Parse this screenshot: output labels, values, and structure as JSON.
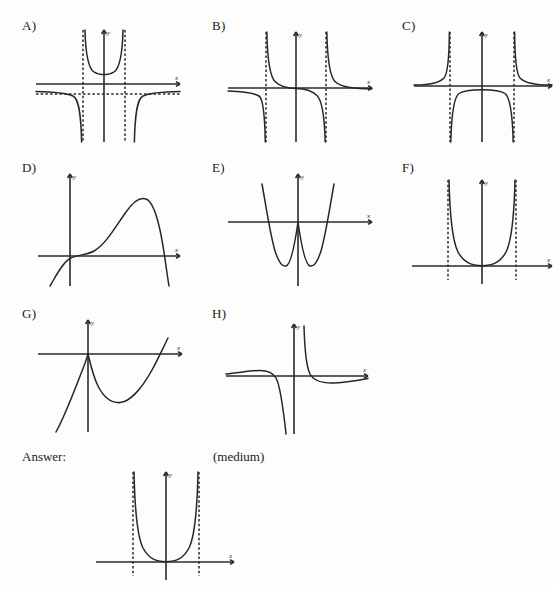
{
  "document": {
    "type": "math-worksheet",
    "topic": "identify-the-graph-multiple-choice",
    "background_color": "#fdfdfc",
    "ink_color": "#262626"
  },
  "answer_row": {
    "answer_label": "Answer:",
    "difficulty_label": "(medium)",
    "answer_matches_option": "F"
  },
  "axis_labels": {
    "x": "x",
    "y": "y"
  },
  "options": [
    {
      "id": "A",
      "label": "A)",
      "description": "rational function with two vertical asymptotes and a horizontal asymptote below the x-axis; middle branch is an upward U between the asymptotes, outer branches fall to the horizontal asymptote",
      "vertical_asymptotes": [
        -0.9,
        0.9
      ],
      "horizontal_asymptote": -0.35,
      "middle_branch": "up",
      "outer_branches": "down"
    },
    {
      "id": "B",
      "label": "B)",
      "description": "two vertical asymptotes, each branch descends to minus infinity on the left side and comes down from plus infinity on the right side; horizontal asymptote at y = 0",
      "vertical_asymptotes": [
        -1.0,
        1.0
      ],
      "horizontal_asymptote": 0,
      "middle_branch": "decreasing",
      "outer_branches": "hyperbolic"
    },
    {
      "id": "C",
      "label": "C)",
      "description": "two vertical asymptotes, outer branches rise to plus infinity, middle branch is a downward arch going to minus infinity at both asymptotes",
      "vertical_asymptotes": [
        -1.0,
        1.0
      ],
      "horizontal_asymptote": 0,
      "middle_branch": "down",
      "outer_branches": "up"
    },
    {
      "id": "D",
      "label": "D)",
      "description": "smooth cubic-like polynomial rising from lower left, crossing near the origin, peaking at the right and falling steeply through the x-axis",
      "shape": "cubic",
      "turning_points": 1,
      "x_intercepts": 2
    },
    {
      "id": "E",
      "label": "E)",
      "description": "W-shaped quartic polynomial with two minima below the x-axis and a local maximum at the origin",
      "shape": "quartic-w",
      "turning_points": 3,
      "x_intercepts": 3
    },
    {
      "id": "F",
      "label": "F)",
      "description": "U-shaped branch between two vertical asymptotes touching the x-axis at the origin, rising to plus infinity at both asymptotes",
      "vertical_asymptotes": [
        -1.0,
        1.0
      ],
      "middle_branch": "up",
      "outer_branches": "none"
    },
    {
      "id": "G",
      "label": "G)",
      "description": "curve with a sharp cusp at the y-axis, descending to a minimum and rising to cross the x-axis on the right; left piece drops steeply to lower left",
      "shape": "cusp-parabola",
      "turning_points": 1
    },
    {
      "id": "H",
      "label": "H)",
      "description": "rational function with one vertical asymptote just right of the y-axis; left branch rises from the horizontal asymptote then plunges to minus infinity, right branch falls from plus infinity to the horizontal asymptote",
      "vertical_asymptotes": [
        0.25
      ],
      "horizontal_asymptote": 0,
      "shape": "single-asymptote-hyperbola"
    }
  ]
}
